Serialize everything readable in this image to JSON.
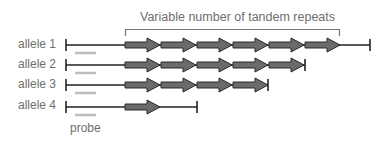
{
  "title": "Variable number of tandem repeats",
  "probe_label": "probe",
  "colors": {
    "line": "#222222",
    "arrow_fill": "#6b6b6b",
    "arrow_stroke": "#2a2a2a",
    "probe": "#bdbdbd",
    "text": "#6e6e6e",
    "bracket": "#777777"
  },
  "alleles": [
    {
      "label": "allele 1",
      "repeats": 6,
      "y": 45,
      "line_end": 370
    },
    {
      "label": "allele 2",
      "repeats": 5,
      "y": 65,
      "line_end": 305
    },
    {
      "label": "allele 3",
      "repeats": 4,
      "y": 85,
      "line_end": 268
    },
    {
      "label": "allele 4",
      "repeats": 1,
      "y": 107,
      "line_end": 197
    }
  ]
}
